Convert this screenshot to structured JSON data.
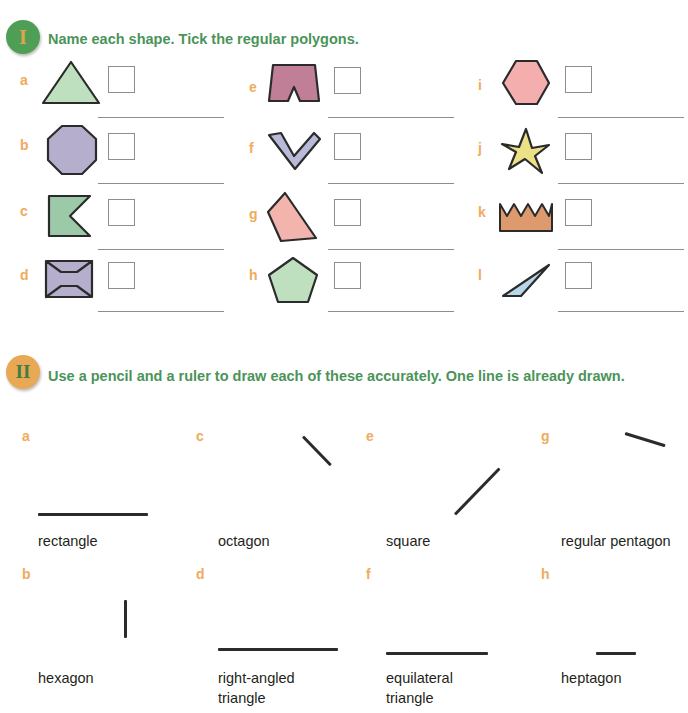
{
  "sections": [
    {
      "badge": "I",
      "heading": "Name each shape. Tick the regular polygons.",
      "items": [
        {
          "letter": "a",
          "shape": "triangle"
        },
        {
          "letter": "b",
          "shape": "octagon"
        },
        {
          "letter": "c",
          "shape": "concave-flag-pentagon"
        },
        {
          "letter": "d",
          "shape": "bowtie-hexagon"
        },
        {
          "letter": "e",
          "shape": "notched-trapezium"
        },
        {
          "letter": "f",
          "shape": "chevron"
        },
        {
          "letter": "g",
          "shape": "irregular-quadrilateral"
        },
        {
          "letter": "h",
          "shape": "pentagon"
        },
        {
          "letter": "i",
          "shape": "hexagon"
        },
        {
          "letter": "j",
          "shape": "star"
        },
        {
          "letter": "k",
          "shape": "crown-zigzag"
        },
        {
          "letter": "l",
          "shape": "thin-triangle"
        }
      ]
    },
    {
      "badge": "II",
      "heading": "Use a pencil and a ruler to draw each of these accurately. One line is already drawn.",
      "items": [
        {
          "letter": "a",
          "label": "rectangle"
        },
        {
          "letter": "b",
          "label": "hexagon"
        },
        {
          "letter": "c",
          "label": "octagon"
        },
        {
          "letter": "d",
          "label": "right-angled\ntriangle"
        },
        {
          "letter": "e",
          "label": "square"
        },
        {
          "letter": "f",
          "label": "equilateral\ntriangle"
        },
        {
          "letter": "g",
          "label": "regular pentagon"
        },
        {
          "letter": "h",
          "label": "heptagon"
        }
      ]
    }
  ],
  "colors": {
    "heading_green": "#4b9459",
    "letter_orange": "#f0ab5b",
    "badge1_bg": "#4f9e56",
    "badge1_fg": "#e0a54a",
    "badge2_bg": "#e9a853",
    "badge2_fg": "#3f7d46",
    "rule_gray": "#8d8d8d",
    "stroke_black": "#2b2b2b",
    "shape_green": "#bfe0bf",
    "shape_purple": "#b5aecd",
    "shape_teal_green": "#9ccaa8",
    "shape_mauve": "#c07f96",
    "shape_lavender": "#b9bad8",
    "shape_pink": "#f3b4ae",
    "shape_hexpink": "#f4aead",
    "shape_yellow": "#ece187",
    "shape_brown": "#dc9a6e",
    "shape_blue": "#b7d6e8",
    "shape_outline": "#2b2b2b"
  }
}
